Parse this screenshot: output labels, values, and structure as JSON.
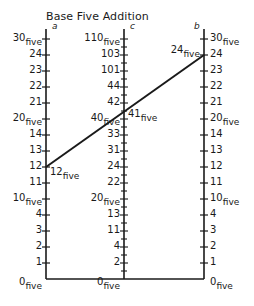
{
  "title": "Base Five Addition",
  "colors": {
    "ink": "#1a1a1a",
    "background": "#ffffff"
  },
  "axes": {
    "a": {
      "name": "a",
      "labels": [
        "0five",
        "1",
        "2",
        "3",
        "4",
        "10five",
        "11",
        "12",
        "13",
        "14",
        "20five",
        "21",
        "22",
        "23",
        "24",
        "30five"
      ]
    },
    "c": {
      "name": "c",
      "labels": [
        "0five",
        "2",
        "4",
        "11",
        "13",
        "20five",
        "22",
        "24",
        "31",
        "33",
        "40five",
        "42",
        "44",
        "101",
        "103",
        "110five"
      ]
    },
    "b": {
      "name": "b",
      "labels": [
        "0five",
        "1",
        "2",
        "3",
        "4",
        "10five",
        "11",
        "12",
        "13",
        "14",
        "20five",
        "21",
        "22",
        "23",
        "24",
        "30five"
      ]
    }
  },
  "example": {
    "a_value": "12",
    "b_value": "24",
    "c_value": "41",
    "subscript": "five"
  },
  "chart_data": {
    "type": "nomogram",
    "title": "Base Five Addition",
    "scales": [
      {
        "name": "a",
        "min": 0,
        "max": 15,
        "base": 5,
        "tick_labels": [
          "0five",
          "1",
          "2",
          "3",
          "4",
          "10five",
          "11",
          "12",
          "13",
          "14",
          "20five",
          "21",
          "22",
          "23",
          "24",
          "30five"
        ]
      },
      {
        "name": "c",
        "min": 0,
        "max": 30,
        "base": 5,
        "tick_labels": [
          "0five",
          "2",
          "4",
          "11",
          "13",
          "20five",
          "22",
          "24",
          "31",
          "33",
          "40five",
          "42",
          "44",
          "101",
          "103",
          "110five"
        ],
        "minor_ticks_between_labels": true
      },
      {
        "name": "b",
        "min": 0,
        "max": 15,
        "base": 5,
        "tick_labels": [
          "0five",
          "1",
          "2",
          "3",
          "4",
          "10five",
          "11",
          "12",
          "13",
          "14",
          "20five",
          "21",
          "22",
          "23",
          "24",
          "30five"
        ]
      }
    ],
    "example_line": {
      "a": "12five",
      "b": "24five",
      "c": "41five",
      "a_decimal": 7,
      "b_decimal": 14,
      "c_decimal": 21
    }
  }
}
